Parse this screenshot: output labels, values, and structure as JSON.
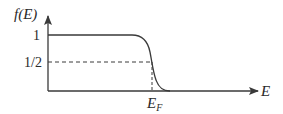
{
  "diagram": {
    "y_axis_label": "f(E)",
    "x_axis_label": "E",
    "y_ticks": [
      {
        "label": "1",
        "value": 1
      },
      {
        "label": "1/2",
        "value": 0.5
      }
    ],
    "x_marker": {
      "label": "E",
      "subscript": "F"
    },
    "colors": {
      "line": "#3a3a3a",
      "axis": "#3a3a3a",
      "dashed": "#3a3a3a",
      "text": "#2a2a2a"
    }
  }
}
